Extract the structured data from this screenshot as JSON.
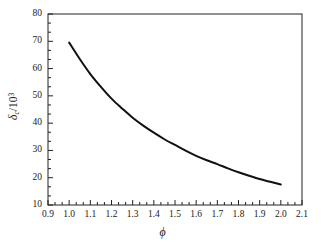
{
  "chart_data": {
    "type": "line",
    "title": "",
    "subtitle": "",
    "xlabel": "ϕ",
    "ylabel_symbol": "δ",
    "ylabel_subscript": "c",
    "ylabel_divisor_base": "10",
    "ylabel_divisor_exponent": "3",
    "ylabel_full": "δc/10³",
    "xlim": [
      0.9,
      2.1
    ],
    "ylim": [
      10,
      80
    ],
    "xticks": [
      "0.9",
      "1.0",
      "1.1",
      "1.2",
      "1.3",
      "1.4",
      "1.5",
      "1.6",
      "1.7",
      "1.8",
      "1.9",
      "2.0",
      "2.1"
    ],
    "xtick_values": [
      0.9,
      1.0,
      1.1,
      1.2,
      1.3,
      1.4,
      1.5,
      1.6,
      1.7,
      1.8,
      1.9,
      2.0,
      2.1
    ],
    "yticks": [
      "10",
      "20",
      "30",
      "40",
      "50",
      "60",
      "70",
      "80"
    ],
    "ytick_values": [
      10,
      20,
      30,
      40,
      50,
      60,
      70,
      80
    ],
    "x_minor_per_major": 2,
    "y_minor_per_major": 2,
    "grid": false,
    "legend": null,
    "legend_position": "none",
    "tick_direction": "in",
    "frame": true,
    "line_color": "#111111",
    "line_width": 2.0,
    "series": [
      {
        "name": "δc/10³ vs ϕ",
        "x": [
          1.0,
          1.05,
          1.1,
          1.15,
          1.2,
          1.25,
          1.3,
          1.35,
          1.4,
          1.45,
          1.5,
          1.55,
          1.6,
          1.65,
          1.7,
          1.75,
          1.8,
          1.85,
          1.9,
          1.95,
          2.0
        ],
        "values": [
          69.5,
          63.5,
          58.0,
          53.3,
          49.0,
          45.4,
          42.0,
          39.1,
          36.5,
          34.1,
          32.0,
          29.9,
          28.0,
          26.4,
          25.0,
          23.4,
          22.0,
          20.7,
          19.5,
          18.5,
          17.5
        ]
      }
    ]
  }
}
